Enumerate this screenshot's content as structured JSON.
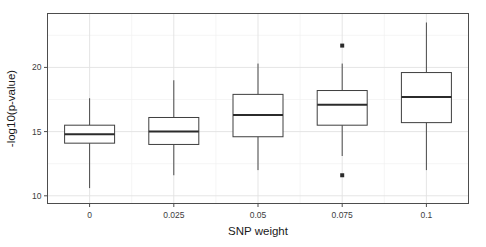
{
  "chart_data": {
    "type": "box",
    "title": "",
    "subtitle": "",
    "xlabel": "SNP weight",
    "ylabel": "-log10(p-value)",
    "categories": [
      "0",
      "0.025",
      "0.05",
      "0.075",
      "0.1"
    ],
    "xtick_labels": [
      "0",
      "0.025",
      "0.05",
      "0.075",
      "0.1"
    ],
    "ytick_labels": [
      "10",
      "15",
      "20"
    ],
    "yticks": [
      10,
      15,
      20
    ],
    "ylim": [
      9.4,
      24.2
    ],
    "grid": true,
    "grid_minor_y": [
      12.5,
      17.5,
      22.5
    ],
    "legend": null,
    "legend_position": "none",
    "boxes": [
      {
        "category": "0",
        "whisker_low": 10.6,
        "q1": 14.1,
        "median": 14.8,
        "q3": 15.5,
        "whisker_high": 17.6,
        "outliers": []
      },
      {
        "category": "0.025",
        "whisker_low": 11.6,
        "q1": 14.0,
        "median": 15.0,
        "q3": 16.1,
        "whisker_high": 19.0,
        "outliers": []
      },
      {
        "category": "0.05",
        "whisker_low": 12.0,
        "q1": 14.6,
        "median": 16.3,
        "q3": 17.9,
        "whisker_high": 20.3,
        "outliers": []
      },
      {
        "category": "0.075",
        "whisker_low": 13.1,
        "q1": 15.5,
        "median": 17.1,
        "q3": 18.2,
        "whisker_high": 20.3,
        "outliers": [
          21.7,
          11.6
        ]
      },
      {
        "category": "0.1",
        "whisker_low": 12.0,
        "q1": 15.7,
        "median": 17.7,
        "q3": 19.6,
        "whisker_high": 23.5,
        "outliers": []
      }
    ],
    "colors": {
      "box_fill": "#ffffff",
      "box_stroke": "#3f3f3f",
      "median": "#2b2b2b",
      "whisker": "#4a4a4a",
      "outlier": "#2b2b2b",
      "grid_major": "#e2e2e2",
      "grid_minor": "#f0f0f0",
      "panel_border": "#4d4d4d",
      "background": "#ffffff",
      "text": "#1a1a1a"
    }
  }
}
